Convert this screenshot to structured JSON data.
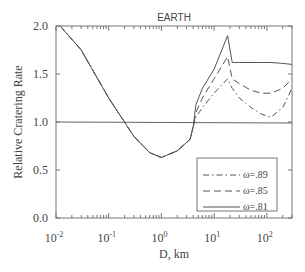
{
  "chart_data": {
    "type": "line",
    "title": "EARTH",
    "xlabel": "D, km",
    "ylabel": "Relative Cratering Rate",
    "xscale": "log",
    "xlim": [
      0.01,
      300
    ],
    "ylim": [
      0.0,
      2.0
    ],
    "x_tick_labels": [
      "10-2",
      "10-1",
      "100",
      "101",
      "102"
    ],
    "x_tick_exponents": [
      "-2",
      "-1",
      "0",
      "1",
      "2"
    ],
    "y_tick_labels": [
      "0.0",
      "0.5",
      "1.0",
      "1.5",
      "2.0"
    ],
    "grid": false,
    "reference_line": {
      "y": 1.0
    },
    "legend_position": "lower right",
    "series": [
      {
        "name": "ω=.89",
        "style": "dash-dot",
        "x": [
          0.012,
          0.03,
          0.1,
          0.3,
          0.6,
          1.0,
          2.0,
          3.5,
          4.0,
          4.5,
          6,
          10,
          18,
          22,
          30,
          50,
          80,
          120,
          200,
          300
        ],
        "y": [
          2.0,
          1.75,
          1.25,
          0.85,
          0.68,
          0.63,
          0.7,
          0.82,
          0.95,
          1.05,
          1.15,
          1.3,
          1.45,
          1.35,
          1.25,
          1.15,
          1.08,
          1.05,
          1.15,
          1.35
        ]
      },
      {
        "name": "ω=.85",
        "style": "dashed",
        "x": [
          0.012,
          0.03,
          0.1,
          0.3,
          0.6,
          1.0,
          2.0,
          3.5,
          4.0,
          4.5,
          6,
          10,
          18,
          22,
          30,
          50,
          80,
          120,
          200,
          300
        ],
        "y": [
          2.0,
          1.75,
          1.25,
          0.85,
          0.68,
          0.63,
          0.7,
          0.82,
          0.95,
          1.1,
          1.25,
          1.45,
          1.68,
          1.45,
          1.4,
          1.33,
          1.3,
          1.3,
          1.35,
          1.45
        ]
      },
      {
        "name": "ω=.81",
        "style": "solid",
        "x": [
          0.012,
          0.03,
          0.1,
          0.3,
          0.6,
          1.0,
          2.0,
          3.5,
          4.0,
          4.5,
          6,
          10,
          18,
          22,
          30,
          50,
          80,
          120,
          200,
          300
        ],
        "y": [
          2.0,
          1.75,
          1.25,
          0.85,
          0.68,
          0.63,
          0.7,
          0.82,
          0.95,
          1.18,
          1.35,
          1.55,
          1.9,
          1.62,
          1.62,
          1.62,
          1.62,
          1.62,
          1.61,
          1.6
        ]
      }
    ],
    "legend": [
      {
        "label": "ω=.89",
        "style": "dash-dot"
      },
      {
        "label": "ω=.85",
        "style": "dashed"
      },
      {
        "label": "ω=.81",
        "style": "solid"
      }
    ],
    "colors": {
      "line": "#555555",
      "axis": "#666666",
      "text": "#444444"
    }
  }
}
